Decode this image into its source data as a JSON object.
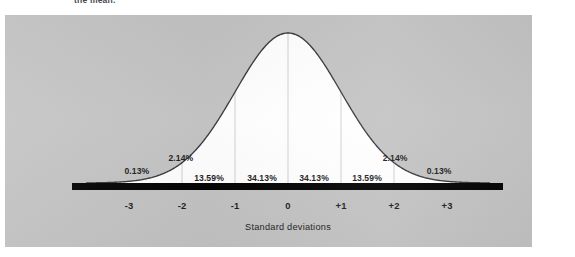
{
  "caption_fragment": "the mean.",
  "colors": {
    "panel_background": "#c3c3c3",
    "curve_fill": "#ffffff",
    "curve_stroke": "#34343a",
    "baseline_bar": "#000000",
    "gridline": "#ffffff",
    "text": "#1b1b1b",
    "page_background": "#ffffff"
  },
  "chart_data": {
    "type": "area",
    "title": "",
    "subtitle": "",
    "xlabel": "Standard deviations",
    "ylabel": "",
    "xlim": [
      -3.8,
      3.8
    ],
    "ylim": [
      0,
      0.42
    ],
    "grid": true,
    "gridlines_at": [
      -2,
      -1,
      0,
      1,
      2
    ],
    "legend": "none",
    "distribution": "normal",
    "mean": 0,
    "sd": 1,
    "x_ticks": [
      -3,
      -2,
      -1,
      0,
      1,
      2,
      3
    ],
    "x_tick_labels": [
      "-3",
      "-2",
      "-1",
      "0",
      "+1",
      "+2",
      "+3"
    ],
    "bands": [
      {
        "id": "band-m3-m2",
        "from": -3,
        "to": -2,
        "label": "0.13%",
        "value": 0.13,
        "label_x": -2.85,
        "label_y_px": 171,
        "on_curve": false
      },
      {
        "id": "band-m2-m1",
        "from": -2,
        "to": -1,
        "label": "2.14%",
        "value": 2.14,
        "label_x": -2.02,
        "label_y_px": 158,
        "on_curve": false
      },
      {
        "id": "band-m1-m0",
        "from": -1,
        "to": 0,
        "label": "13.59%",
        "value": 13.59,
        "label_x": -1.49,
        "label_y_px": 178,
        "on_curve": true
      },
      {
        "id": "band-0-p1",
        "from": 0,
        "to": 1,
        "label": "34.13%",
        "value": 34.13,
        "label_x": -0.49,
        "label_y_px": 178,
        "on_curve": true
      },
      {
        "id": "band-p1-p2",
        "from": 1,
        "to": 2,
        "label": "34.13%",
        "value": 34.13,
        "label_x": 0.49,
        "label_y_px": 178,
        "on_curve": true
      },
      {
        "id": "band-p2-p3",
        "from": 2,
        "to": 3,
        "label": "13.59%",
        "value": 13.59,
        "label_x": 1.49,
        "label_y_px": 178,
        "on_curve": true
      },
      {
        "id": "band-p3-p4",
        "from": 3,
        "to": 4,
        "label": "2.14%",
        "value": 2.14,
        "label_x": 2.02,
        "label_y_px": 158,
        "on_curve": false
      },
      {
        "id": "band-p4-p5",
        "from": 4,
        "to": 5,
        "label": "0.13%",
        "value": 0.13,
        "label_x": 2.85,
        "label_y_px": 171,
        "on_curve": false
      }
    ],
    "percent_labels_in_order": [
      "0.13%",
      "2.14%",
      "13.59%",
      "34.13%",
      "34.13%",
      "13.59%",
      "2.14%",
      "0.13%"
    ]
  }
}
